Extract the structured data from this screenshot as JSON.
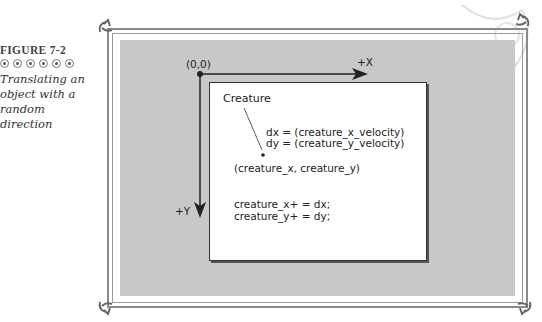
{
  "caption": {
    "figure_label": "FIGURE 7-2",
    "bullet_count": 6,
    "title_lines": [
      "Translating an",
      "object with a",
      "random direction"
    ]
  },
  "diagram": {
    "origin_label": "(0,0)",
    "x_axis_label": "+X",
    "y_axis_label": "+Y",
    "object_label": "Creature",
    "velocity_lines": [
      "dx = (creature_x_velocity)",
      "dy = (creature_y_velocity)"
    ],
    "position_label": "(creature_x, creature_y)",
    "code_lines": [
      "creature_x+ = dx;",
      "creature_y+ = dy;"
    ]
  }
}
